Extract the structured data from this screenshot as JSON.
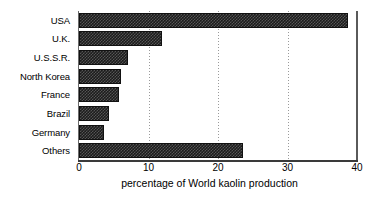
{
  "chart_data": {
    "type": "bar",
    "orientation": "horizontal",
    "title": "",
    "xlabel": "percentage of World kaolin production",
    "ylabel": "",
    "xlim": [
      0,
      40
    ],
    "ylim": null,
    "grid": "vertical-dotted",
    "legend": "none",
    "xticks": [
      0,
      10,
      20,
      30,
      40
    ],
    "xtick_labels": [
      "0",
      "10",
      "20",
      "30",
      "40"
    ],
    "categories": [
      "USA",
      "U.K.",
      "U.S.S.R.",
      "North Korea",
      "France",
      "Brazil",
      "Germany",
      "Others"
    ],
    "values": [
      38.7,
      12.0,
      7.0,
      6.1,
      5.8,
      4.3,
      3.6,
      23.6
    ],
    "series": [
      {
        "name": "percentage of World kaolin production",
        "values": [
          38.7,
          12.0,
          7.0,
          6.1,
          5.8,
          4.3,
          3.6,
          23.6
        ]
      }
    ],
    "bar_fill": "#1c1c1c",
    "bar_pattern": "checkered-stipple",
    "axis_color": "#000000",
    "gridline_color": "#9a9a9a",
    "background_color": "#ffffff"
  }
}
